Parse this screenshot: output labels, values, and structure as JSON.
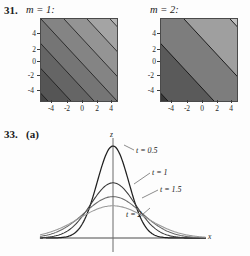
{
  "page": {
    "background": "#fdfdfd",
    "width": 250,
    "height": 256
  },
  "problem31": {
    "number": "31.",
    "left_plot": {
      "title": "m = 1:",
      "xticks": [
        "-4",
        "-2",
        "0",
        "2",
        "4"
      ],
      "yticks": [
        "4",
        "2",
        "0",
        "-2",
        "-4"
      ],
      "band_count": 14,
      "frame_color": "#4a4a4a"
    },
    "right_plot": {
      "title": "m = 2:",
      "xticks": [
        "-4",
        "-2",
        "0",
        "2",
        "4"
      ],
      "yticks": [
        "4",
        "2",
        "0",
        "-2",
        "-4"
      ],
      "band_count": 7,
      "frame_color": "#4a4a4a"
    }
  },
  "problem33": {
    "number": "33.",
    "part": "(a)",
    "axis_labels": {
      "vertical": "z",
      "horizontal": "x"
    },
    "curve_labels": [
      {
        "text": "t = 0.5"
      },
      {
        "text": "t = 1"
      },
      {
        "text": "t = 1.5"
      },
      {
        "text": "t = 2"
      }
    ]
  },
  "chart_data": [
    {
      "type": "heatmap",
      "title": "m = 1:",
      "xlabel": "",
      "ylabel": "",
      "xlim": [
        -5,
        5
      ],
      "ylim": [
        -5,
        5
      ],
      "xticks": [
        -4,
        -2,
        0,
        2,
        4
      ],
      "yticks": [
        -4,
        -2,
        0,
        2,
        4
      ],
      "description": "Grayscale contour density plot of a linear function, level sets are parallel lines of slope -1 running from lower-left (dark) to upper-right (light); 14 contour bands",
      "band_count": 14,
      "orientation": "diagonal",
      "dark_corner": "lower-left",
      "light_corner": "upper-right",
      "grid": false,
      "legend": "none"
    },
    {
      "type": "heatmap",
      "title": "m = 2:",
      "xlabel": "",
      "ylabel": "",
      "xlim": [
        -5,
        5
      ],
      "ylim": [
        -5,
        5
      ],
      "xticks": [
        -4,
        -2,
        0,
        2,
        4
      ],
      "yticks": [
        -4,
        -2,
        0,
        2,
        4
      ],
      "description": "Grayscale contour density plot of a linear function, level sets are parallel lines of slope -1 running from lower-left (dark) to upper-right (light); 7 broader contour bands",
      "band_count": 7,
      "orientation": "diagonal",
      "dark_corner": "lower-left",
      "light_corner": "upper-right",
      "grid": false,
      "legend": "none"
    },
    {
      "type": "line",
      "title": "33. (a)",
      "xlabel": "x",
      "ylabel": "z",
      "xlim": [
        -4,
        4
      ],
      "ylim": [
        0,
        1.15
      ],
      "grid": false,
      "legend": "inline-annotations",
      "description": "Four bell-shaped (Gaussian heat-kernel) curves z = (1/sqrt(t)) exp(-x^2/t), peaks decrease and widths increase as t increases",
      "series": [
        {
          "name": "t = 0.5",
          "peak": 1.0,
          "halfwidth": 0.72,
          "color": "#1f1f1f",
          "x": [
            -4,
            -3,
            -2.5,
            -2,
            -1.5,
            -1,
            -0.5,
            0,
            0.5,
            1,
            1.5,
            2,
            2.5,
            3,
            4
          ],
          "values": [
            0.0,
            0.01,
            0.04,
            0.12,
            0.3,
            0.57,
            0.87,
            1.0,
            0.87,
            0.57,
            0.3,
            0.12,
            0.04,
            0.01,
            0.0
          ]
        },
        {
          "name": "t = 1",
          "peak": 0.6,
          "halfwidth": 1.02,
          "color": "#3a3a3a",
          "x": [
            -4,
            -3,
            -2.5,
            -2,
            -1.5,
            -1,
            -0.5,
            0,
            0.5,
            1,
            1.5,
            2,
            2.5,
            3,
            4
          ],
          "values": [
            0.02,
            0.06,
            0.11,
            0.18,
            0.28,
            0.4,
            0.52,
            0.6,
            0.52,
            0.4,
            0.28,
            0.18,
            0.11,
            0.06,
            0.02
          ]
        },
        {
          "name": "t = 1.5",
          "peak": 0.45,
          "halfwidth": 1.3,
          "color": "#6a6a6a",
          "x": [
            -4,
            -3,
            -2.5,
            -2,
            -1.5,
            -1,
            -0.5,
            0,
            0.5,
            1,
            1.5,
            2,
            2.5,
            3,
            4
          ],
          "values": [
            0.04,
            0.09,
            0.13,
            0.19,
            0.26,
            0.33,
            0.41,
            0.45,
            0.41,
            0.33,
            0.26,
            0.19,
            0.13,
            0.09,
            0.04
          ]
        },
        {
          "name": "t = 2",
          "peak": 0.35,
          "halfwidth": 1.55,
          "color": "#9a9a9a",
          "x": [
            -4,
            -3,
            -2.5,
            -2,
            -1.5,
            -1,
            -0.5,
            0,
            0.5,
            1,
            1.5,
            2,
            2.5,
            3,
            4
          ],
          "values": [
            0.06,
            0.11,
            0.15,
            0.19,
            0.24,
            0.28,
            0.32,
            0.35,
            0.32,
            0.28,
            0.24,
            0.19,
            0.15,
            0.11,
            0.06
          ]
        }
      ]
    }
  ]
}
